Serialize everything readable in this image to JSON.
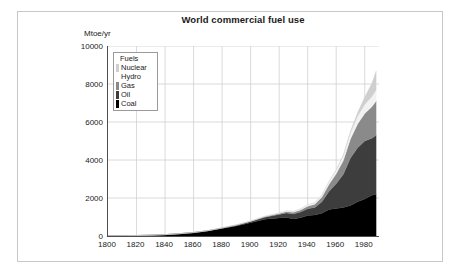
{
  "chart_data": {
    "type": "area",
    "stacked": true,
    "title": "World commercial fuel use",
    "xlabel": "",
    "ylabel": "Mtoe/yr",
    "xlim": [
      1800,
      1990
    ],
    "ylim": [
      0,
      10000
    ],
    "grid": true,
    "legend_position": "upper-left-inside",
    "legend_title": "Fuels",
    "xticks": [
      1800,
      1820,
      1840,
      1860,
      1880,
      1900,
      1920,
      1940,
      1960,
      1980
    ],
    "yticks": [
      0,
      2000,
      4000,
      6000,
      8000,
      10000
    ],
    "x": [
      1800,
      1810,
      1820,
      1830,
      1840,
      1850,
      1860,
      1870,
      1880,
      1890,
      1900,
      1910,
      1920,
      1925,
      1930,
      1935,
      1940,
      1945,
      1950,
      1955,
      1960,
      1965,
      1970,
      1975,
      1980,
      1985,
      1988
    ],
    "series": [
      {
        "name": "Coal",
        "color": "#000000",
        "values": [
          10,
          15,
          25,
          40,
          70,
          120,
          180,
          270,
          400,
          530,
          700,
          880,
          950,
          980,
          900,
          960,
          1080,
          1100,
          1200,
          1400,
          1450,
          1500,
          1600,
          1800,
          1950,
          2150,
          2200
        ]
      },
      {
        "name": "Oil",
        "color": "#3d3d3d",
        "values": [
          0,
          0,
          0,
          0,
          0,
          0,
          2,
          8,
          20,
          35,
          60,
          110,
          180,
          230,
          260,
          300,
          350,
          400,
          600,
          950,
          1300,
          1750,
          2500,
          2850,
          3050,
          3000,
          3100
        ]
      },
      {
        "name": "Gas",
        "color": "#8a8a8a",
        "values": [
          0,
          0,
          0,
          0,
          0,
          0,
          0,
          2,
          5,
          10,
          18,
          30,
          50,
          70,
          90,
          110,
          140,
          170,
          250,
          380,
          520,
          720,
          1000,
          1250,
          1450,
          1650,
          1800
        ]
      },
      {
        "name": "Hydro",
        "color": "#f2f2f2",
        "values": [
          0,
          0,
          0,
          0,
          0,
          0,
          0,
          0,
          2,
          5,
          10,
          18,
          30,
          40,
          50,
          60,
          75,
          85,
          110,
          150,
          200,
          260,
          330,
          400,
          470,
          540,
          580
        ]
      },
      {
        "name": "Nuclear",
        "color": "#cfcfcf",
        "values": [
          0,
          0,
          0,
          0,
          0,
          0,
          0,
          0,
          0,
          0,
          0,
          0,
          0,
          0,
          0,
          0,
          0,
          0,
          0,
          5,
          15,
          40,
          90,
          200,
          400,
          700,
          1000
        ]
      }
    ],
    "stack_order_bottom_to_top": [
      "Coal",
      "Oil",
      "Gas",
      "Hydro",
      "Nuclear"
    ],
    "legend_entries": [
      {
        "label": "Nuclear",
        "color": "#cfcfcf"
      },
      {
        "label": "Hydro",
        "color": "#fbfbfb"
      },
      {
        "label": "Gas",
        "color": "#8a8a8a"
      },
      {
        "label": "Oil",
        "color": "#3d3d3d"
      },
      {
        "label": "Coal",
        "color": "#000000"
      }
    ]
  },
  "style": {
    "grid_color": "#d0d0d0",
    "axis_color": "#4d4d4d",
    "frame_color": "#c8c8c8",
    "background": "#ffffff",
    "text_color": "#1a1a1a"
  }
}
